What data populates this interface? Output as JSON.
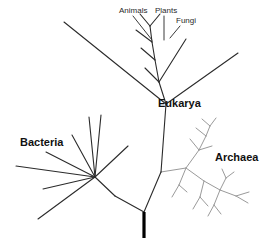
{
  "figure": {
    "background_color": "#ffffff",
    "width": 269,
    "height": 243
  },
  "style": {
    "dark_branch_color": "#2b2b2b",
    "light_branch_color": "#9a9a9a",
    "root_color": "#000000",
    "label_color": "#111111",
    "tip_label_color": "#2a2a2a"
  },
  "labels": {
    "domains": [
      {
        "name": "bacteria",
        "text": "Bacteria",
        "x": 20,
        "y": 143,
        "anchor": "start"
      },
      {
        "name": "eukarya",
        "text": "Eukarya",
        "x": 158,
        "y": 104,
        "anchor": "start"
      },
      {
        "name": "archaea",
        "text": "Archaea",
        "x": 215,
        "y": 158,
        "anchor": "start"
      }
    ],
    "tips": [
      {
        "name": "animals",
        "text": "Animals",
        "x": 119,
        "y": 11,
        "anchor": "start"
      },
      {
        "name": "plants",
        "text": "Plants",
        "x": 155,
        "y": 11,
        "anchor": "start"
      },
      {
        "name": "fungi",
        "text": "Fungi",
        "x": 176,
        "y": 21,
        "anchor": "start"
      }
    ]
  },
  "chart_data": {
    "type": "diagram",
    "diagram_kind": "unrooted-phylogenetic-tree",
    "domains": [
      "Bacteria",
      "Archaea",
      "Eukarya"
    ],
    "named_tips": [
      "Animals",
      "Plants",
      "Fungi"
    ],
    "root": {
      "x": 144,
      "y_top": 212,
      "y_bottom": 238
    },
    "nodes": {
      "root_node": [
        144,
        212
      ],
      "bacteria_stem_node": [
        115,
        196
      ],
      "bacteria_hub": [
        95,
        177
      ],
      "eukarya_archaea_node": [
        161,
        172
      ],
      "eukarya_node": [
        166,
        104
      ],
      "eukarya_crown_base": [
        159,
        82
      ],
      "archaea_base": [
        186,
        168
      ]
    },
    "edges_dark": [
      [
        [
          144,
          212
        ],
        [
          115,
          196
        ]
      ],
      [
        [
          115,
          196
        ],
        [
          95,
          177
        ]
      ],
      [
        [
          144,
          212
        ],
        [
          161,
          172
        ]
      ],
      [
        [
          161,
          172
        ],
        [
          166,
          104
        ]
      ],
      [
        [
          166,
          104
        ],
        [
          159,
          82
        ]
      ],
      [
        [
          166,
          104
        ],
        [
          64,
          22
        ]
      ],
      [
        [
          166,
          104
        ],
        [
          238,
          53
        ]
      ],
      [
        [
          95,
          177
        ],
        [
          38,
          219
        ]
      ],
      [
        [
          95,
          177
        ],
        [
          43,
          189
        ]
      ],
      [
        [
          95,
          177
        ],
        [
          16,
          166
        ]
      ],
      [
        [
          95,
          177
        ],
        [
          46,
          152
        ]
      ],
      [
        [
          95,
          177
        ],
        [
          72,
          135
        ]
      ],
      [
        [
          95,
          177
        ],
        [
          89,
          117
        ]
      ],
      [
        [
          95,
          177
        ],
        [
          101,
          115
        ]
      ],
      [
        [
          95,
          177
        ],
        [
          128,
          146
        ]
      ],
      [
        [
          159,
          82
        ],
        [
          155,
          60
        ]
      ],
      [
        [
          155,
          60
        ],
        [
          152,
          42
        ]
      ],
      [
        [
          152,
          42
        ],
        [
          150,
          26
        ]
      ],
      [
        [
          159,
          82
        ],
        [
          145,
          68
        ]
      ],
      [
        [
          155,
          60
        ],
        [
          141,
          48
        ]
      ],
      [
        [
          152,
          42
        ],
        [
          136,
          30
        ]
      ],
      [
        [
          150,
          26
        ],
        [
          140,
          14
        ]
      ],
      [
        [
          150,
          26
        ],
        [
          160,
          14
        ]
      ],
      [
        [
          159,
          82
        ],
        [
          186,
          39
        ]
      ]
    ],
    "edges_light": [
      [
        [
          161,
          172
        ],
        [
          186,
          168
        ]
      ],
      [
        [
          186,
          168
        ],
        [
          199,
          150
        ]
      ],
      [
        [
          199,
          150
        ],
        [
          206,
          136
        ]
      ],
      [
        [
          206,
          136
        ],
        [
          210,
          126
        ]
      ],
      [
        [
          199,
          150
        ],
        [
          190,
          139
        ]
      ],
      [
        [
          206,
          136
        ],
        [
          196,
          128
        ]
      ],
      [
        [
          210,
          126
        ],
        [
          202,
          119
        ]
      ],
      [
        [
          210,
          126
        ],
        [
          216,
          118
        ]
      ],
      [
        [
          199,
          150
        ],
        [
          212,
          146
        ]
      ],
      [
        [
          186,
          168
        ],
        [
          179,
          185
        ]
      ],
      [
        [
          179,
          185
        ],
        [
          172,
          197
        ]
      ],
      [
        [
          179,
          185
        ],
        [
          187,
          192
        ]
      ],
      [
        [
          186,
          168
        ],
        [
          204,
          181
        ]
      ],
      [
        [
          204,
          181
        ],
        [
          220,
          190
        ]
      ],
      [
        [
          220,
          190
        ],
        [
          236,
          196
        ]
      ],
      [
        [
          236,
          196
        ],
        [
          249,
          192
        ]
      ],
      [
        [
          236,
          196
        ],
        [
          248,
          203
        ]
      ],
      [
        [
          220,
          190
        ],
        [
          226,
          178
        ]
      ],
      [
        [
          226,
          178
        ],
        [
          234,
          172
        ]
      ],
      [
        [
          226,
          178
        ],
        [
          222,
          169
        ]
      ],
      [
        [
          204,
          181
        ],
        [
          200,
          197
        ]
      ],
      [
        [
          200,
          197
        ],
        [
          193,
          209
        ]
      ],
      [
        [
          200,
          197
        ],
        [
          208,
          206
        ]
      ],
      [
        [
          220,
          190
        ],
        [
          214,
          205
        ]
      ],
      [
        [
          214,
          205
        ],
        [
          208,
          216
        ]
      ],
      [
        [
          214,
          205
        ],
        [
          221,
          214
        ]
      ]
    ],
    "leaders": [
      {
        "name": "animals-leader",
        "from": [
          133,
          16
        ],
        "to": [
          152,
          40
        ]
      },
      {
        "name": "plants-leader",
        "from": [
          164,
          16
        ],
        "to": [
          164,
          40
        ]
      },
      {
        "name": "fungi-leader",
        "from": [
          180,
          26
        ],
        "to": [
          170,
          38
        ]
      }
    ]
  }
}
